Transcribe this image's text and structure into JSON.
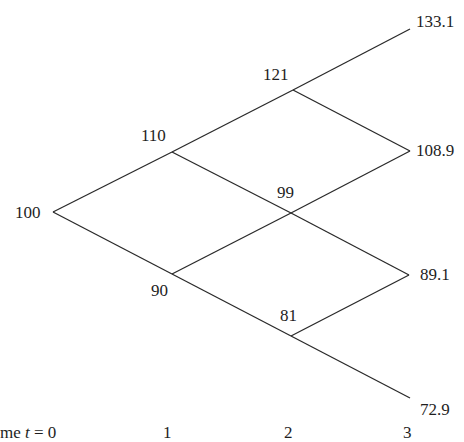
{
  "diagram": {
    "type": "binomial-tree",
    "steps": 3,
    "nodes": [
      {
        "id": "n0_0",
        "t": 0,
        "label": "100"
      },
      {
        "id": "n1_0",
        "t": 1,
        "label": "110"
      },
      {
        "id": "n1_1",
        "t": 1,
        "label": "90"
      },
      {
        "id": "n2_0",
        "t": 2,
        "label": "121"
      },
      {
        "id": "n2_1",
        "t": 2,
        "label": "99"
      },
      {
        "id": "n2_2",
        "t": 2,
        "label": "81"
      },
      {
        "id": "n3_0",
        "t": 3,
        "label": "133.1"
      },
      {
        "id": "n3_1",
        "t": 3,
        "label": "108.9"
      },
      {
        "id": "n3_2",
        "t": 3,
        "label": "89.1"
      },
      {
        "id": "n3_3",
        "t": 3,
        "label": "72.9"
      }
    ],
    "edges": [
      [
        "n0_0",
        "n1_0"
      ],
      [
        "n0_0",
        "n1_1"
      ],
      [
        "n1_0",
        "n2_0"
      ],
      [
        "n1_0",
        "n2_1"
      ],
      [
        "n1_1",
        "n2_1"
      ],
      [
        "n1_1",
        "n2_2"
      ],
      [
        "n2_0",
        "n3_0"
      ],
      [
        "n2_0",
        "n3_1"
      ],
      [
        "n2_1",
        "n3_1"
      ],
      [
        "n2_1",
        "n3_2"
      ],
      [
        "n2_2",
        "n3_2"
      ],
      [
        "n2_2",
        "n3_3"
      ]
    ],
    "time_axis": {
      "prefix": "me ",
      "var": "t",
      "eq": " = 0",
      "ticks": [
        "1",
        "2",
        "3"
      ]
    }
  }
}
